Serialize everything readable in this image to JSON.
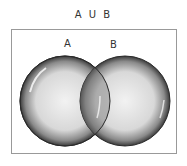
{
  "title": "A U B",
  "sets": [
    {
      "label": "A",
      "cx": 65,
      "cy": 101,
      "r": 45
    },
    {
      "label": "B",
      "cx": 125,
      "cy": 101,
      "r": 45
    }
  ],
  "colors": {
    "edge": "#2a2a2a",
    "fill_light": "#f0f0f0",
    "fill_dark": "#6a6a6a",
    "box": "#999999"
  }
}
